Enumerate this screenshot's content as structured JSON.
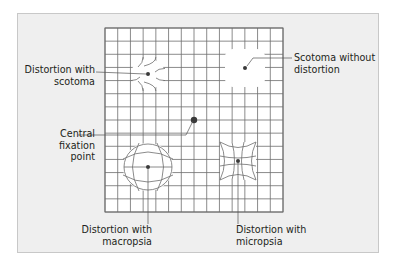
{
  "figure": {
    "type": "amsler-grid",
    "grid": {
      "rows": 14,
      "columns": 14
    },
    "colors": {
      "panel_background": "#efefef",
      "panel_border": "#c8c8c8",
      "grid_background": "#ffffff",
      "grid_line": "#6d6d6d",
      "leader_line": "#555555",
      "point": "#3a3a3a",
      "label_text": "#231f20"
    },
    "labels": {
      "distortion_with_scotoma": [
        "Distortion with",
        "scotoma"
      ],
      "central_fixation_point": [
        "Central",
        "fixation",
        "point"
      ],
      "scotoma_without_distortion": [
        "Scotoma without",
        "distortion"
      ],
      "distortion_with_macropsia": [
        "Distortion with",
        "macropsia"
      ],
      "distortion_with_micropsia": [
        "Distortion with",
        "micropsia"
      ]
    }
  }
}
